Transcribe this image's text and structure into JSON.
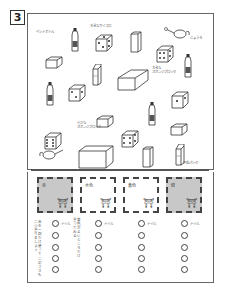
{
  "page": {
    "number": "3"
  },
  "items": {
    "labels": [
      {
        "id": "pet-bottle",
        "text": "ペットボトル",
        "x": 36,
        "y": 30
      },
      {
        "id": "big-dice",
        "text": "大きなサイコロ",
        "x": 90,
        "y": 24
      },
      {
        "id": "watering-can",
        "text": "じょうろ",
        "x": 190,
        "y": 36
      },
      {
        "id": "big-sponge-block",
        "text": "大きな\nスポンジブロック",
        "x": 152,
        "y": 66
      },
      {
        "id": "small-sponge-block",
        "text": "小さな\nスポンジブロック",
        "x": 77,
        "y": 121
      },
      {
        "id": "milk-carton",
        "text": "牛乳パック",
        "x": 183,
        "y": 161
      }
    ]
  },
  "stamps": [
    {
      "label": "赤",
      "gray": true,
      "x": 37
    },
    {
      "label": "水色",
      "gray": false,
      "x": 80
    },
    {
      "label": "黄色",
      "gray": false,
      "x": 123
    },
    {
      "label": "緑",
      "gray": true,
      "x": 166
    }
  ],
  "answer_rows": {
    "first_label": "ナイル",
    "count": 5
  },
  "notes": [
    {
      "text": "赤を一回だけ使って\nこのマスも二つ塗りましょう",
      "x": 33,
      "y": 220
    },
    {
      "text": "黄色がよいところだけ\n塗ってみる",
      "x": 72,
      "y": 218
    }
  ]
}
